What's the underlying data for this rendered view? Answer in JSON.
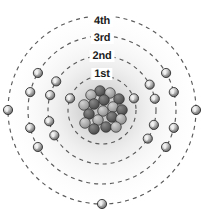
{
  "diagram": {
    "kind": "bohr-atomic-model",
    "title": "",
    "center": {
      "x": 102,
      "y": 110
    },
    "background_color": "#ffffff",
    "halo_color": "#d8d8d8",
    "shells": [
      {
        "label": "1st",
        "index": 1,
        "radius": 34,
        "label_x": 102,
        "label_y": 69,
        "orbit_color": "#5a5a5a",
        "dash": "4 4",
        "electron_count": 2,
        "electron_angles_deg": [
          200,
          340
        ]
      },
      {
        "label": "2nd",
        "index": 2,
        "radius": 54,
        "label_x": 102,
        "label_y": 51,
        "orbit_color": "#5a5a5a",
        "dash": "4 4",
        "electron_count": 8,
        "electron_angles_deg": [
          152,
          168,
          196,
          212,
          332,
          348,
          16,
          32
        ]
      },
      {
        "label": "3rd",
        "index": 3,
        "radius": 74,
        "label_x": 102,
        "label_y": 33,
        "orbit_color": "#5a5a5a",
        "dash": "4 4",
        "electron_count": 8,
        "electron_angles_deg": [
          150,
          166,
          194,
          210,
          330,
          346,
          14,
          30
        ]
      },
      {
        "label": "4th",
        "index": 4,
        "radius": 94,
        "label_x": 102,
        "label_y": 16,
        "orbit_color": "#5a5a5a",
        "dash": "4 4",
        "electron_count": 3,
        "electron_angles_deg": [
          180,
          0,
          90
        ]
      }
    ],
    "electron": {
      "name": "electron",
      "radius_px": 4.6,
      "fill_color": "#8c8c8c",
      "highlight_color": "#f2f2f2",
      "stroke_color": "#2a2a2a"
    },
    "nucleus": {
      "name": "nucleus",
      "radius_px": 23,
      "particle_radius_px": 5.3,
      "proton_color": "#595959",
      "neutron_color": "#a8a8a8",
      "stroke_color": "#2e2e2e",
      "particles": [
        {
          "x": -2,
          "y": -19,
          "type": "proton"
        },
        {
          "x": 8,
          "y": -17,
          "type": "neutron"
        },
        {
          "x": -11,
          "y": -15,
          "type": "neutron"
        },
        {
          "x": 17,
          "y": -11,
          "type": "proton"
        },
        {
          "x": 2,
          "y": -10,
          "type": "proton"
        },
        {
          "x": -8,
          "y": -6,
          "type": "proton"
        },
        {
          "x": -18,
          "y": -5,
          "type": "neutron"
        },
        {
          "x": 11,
          "y": -3,
          "type": "neutron"
        },
        {
          "x": 20,
          "y": 0,
          "type": "proton"
        },
        {
          "x": 1,
          "y": 1,
          "type": "neutron"
        },
        {
          "x": -13,
          "y": 4,
          "type": "proton"
        },
        {
          "x": 10,
          "y": 7,
          "type": "proton"
        },
        {
          "x": -4,
          "y": 10,
          "type": "neutron"
        },
        {
          "x": 19,
          "y": 9,
          "type": "neutron"
        },
        {
          "x": -17,
          "y": 13,
          "type": "neutron"
        },
        {
          "x": 4,
          "y": 17,
          "type": "proton"
        },
        {
          "x": -8,
          "y": 19,
          "type": "proton"
        },
        {
          "x": 14,
          "y": 17,
          "type": "neutron"
        }
      ]
    }
  }
}
